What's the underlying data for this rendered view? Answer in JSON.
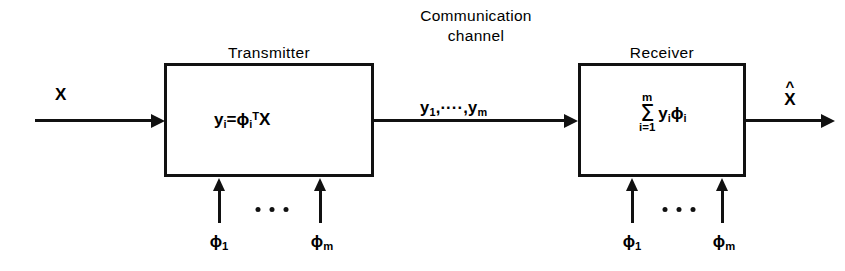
{
  "diagram": {
    "title_transmitter": "Transmitter",
    "title_receiver": "Receiver",
    "channel_title_line1": "Communication",
    "channel_title_line2": "channel",
    "input_label": "X",
    "output_hat_mark": "^",
    "output_base": "X",
    "channel_signal": {
      "y_sym": "y",
      "first_index": "1",
      "ellipsis": ",····,",
      "last_index": "m"
    },
    "transmitter_formula": {
      "y": "y",
      "y_sub": "i",
      "equals": "=",
      "phi": "ϕ",
      "phi_sub": "i",
      "phi_sup": "T",
      "x": "X"
    },
    "receiver_formula": {
      "upper_limit": "m",
      "sigma": "Σ",
      "lower_limit": "i=1",
      "body_y": "y",
      "body_y_sub": "i",
      "body_phi": "ϕ",
      "body_phi_sub": "i"
    },
    "basis_inputs": {
      "first": {
        "symbol": "ϕ",
        "index": "1"
      },
      "last": {
        "symbol": "ϕ",
        "index": "m"
      }
    },
    "colors": {
      "ink": "#111111",
      "background": "#ffffff"
    }
  }
}
